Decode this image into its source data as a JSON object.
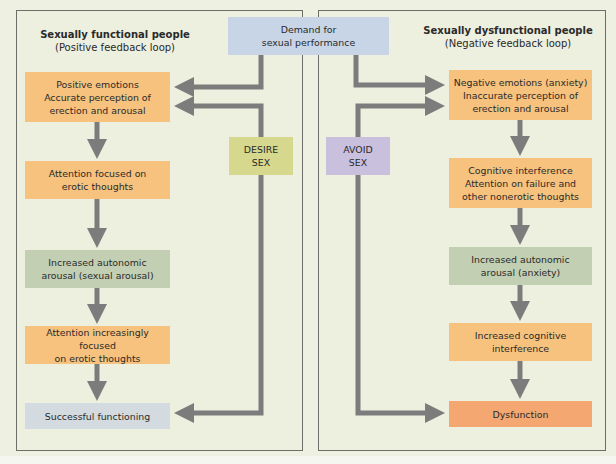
{
  "top": {
    "demand": "Demand for\nsexual performance"
  },
  "left_panel": {
    "title": "Sexually functional people",
    "subtitle": "(Positive feedback loop)",
    "side_label": "DESIRE\nSEX",
    "steps": [
      "Positive emotions\nAccurate perception of\nerection and arousal",
      "Attention focused on\nerotic thoughts",
      "Increased autonomic\narousal (sexual arousal)",
      "Attention increasingly focused\non erotic thoughts",
      "Successful functioning"
    ]
  },
  "right_panel": {
    "title": "Sexually dysfunctional people",
    "subtitle": "(Negative feedback loop)",
    "side_label": "AVOID\nSEX",
    "steps": [
      "Negative emotions (anxiety)\nInaccurate perception of\nerection and arousal",
      "Cognitive interference\nAttention on failure and\nother nonerotic thoughts",
      "Increased autonomic\narousal (anxiety)",
      "Increased cognitive\ninterference",
      "Dysfunction"
    ]
  },
  "colors": {
    "orange": "#f6c27e",
    "green": "#c3cfb2",
    "blue": "#c7d5e7",
    "grey_blue": "#d3dbe0",
    "olive": "#d5d88d",
    "lavender": "#c9c0dd",
    "red_orange": "#f4a771",
    "arrow": "#7c7c7c",
    "background": "#edefdf"
  }
}
